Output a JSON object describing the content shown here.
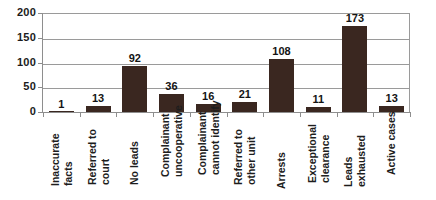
{
  "chart_data": {
    "type": "bar",
    "title": "",
    "xlabel": "",
    "ylabel": "",
    "ylim": [
      0,
      200
    ],
    "yticks": [
      0,
      50,
      100,
      150,
      200
    ],
    "grid": true,
    "legend": "none",
    "bar_color": "#3a2720",
    "categories": [
      "Inaccurate facts",
      "Referred to court",
      "No leads",
      "Complainant uncooperative",
      "Complainant cannot identify",
      "Referred to other unit",
      "Arrests",
      "Exceptional clearance",
      "Leads exhausted",
      "Active cases"
    ],
    "category_lines": [
      [
        "Inaccurate",
        "facts"
      ],
      [
        "Referred to",
        "court"
      ],
      [
        "No leads"
      ],
      [
        "Complainant",
        "uncooperative"
      ],
      [
        "Complainant",
        "cannot identify"
      ],
      [
        "Referred to",
        "other unit"
      ],
      [
        "Arrests"
      ],
      [
        "Exceptional",
        "clearance"
      ],
      [
        "Leads",
        "exhausted"
      ],
      [
        "Active cases"
      ]
    ],
    "values": [
      1,
      13,
      92,
      36,
      16,
      21,
      108,
      11,
      173,
      13
    ],
    "value_labels": [
      "1",
      "13",
      "92",
      "36",
      "16",
      "21",
      "108",
      "11",
      "173",
      "13"
    ],
    "ytick_labels": [
      "0",
      "50",
      "100",
      "150",
      "200"
    ]
  }
}
